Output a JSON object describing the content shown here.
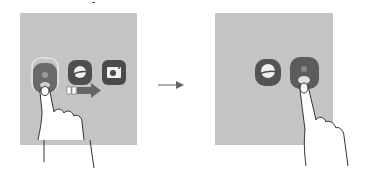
{
  "illustration": {
    "description": "Two-step gesture illustration: tap-and-hold an app icon in a group, drag arrow shows reordering; then tap highlighted icon",
    "step1": {
      "icons": [
        "contacts-icon",
        "internet-browser-icon",
        "camera-icon"
      ],
      "gesture": "tap-and-hold-finger",
      "drag_direction": "right"
    },
    "transition_arrow": "arrow-right-icon",
    "step2": {
      "icons": [
        "internet-browser-icon",
        "contacts-icon"
      ],
      "gesture": "tap-finger"
    },
    "colors": {
      "panel": "#c4c4c4",
      "icon_dark": "#5a5a5a",
      "icon_highlight": "#dcdcdc",
      "arrow": "#666666",
      "outline": "#333333"
    }
  }
}
